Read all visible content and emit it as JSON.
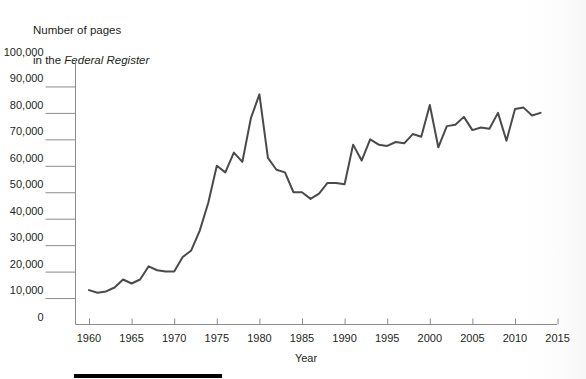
{
  "title": {
    "line1": "Number of pages",
    "line2_prefix": "in the ",
    "line2_italic": "Federal Register"
  },
  "axes": {
    "x_label": "Year",
    "y_ticks": [
      "100,000",
      "90,000",
      "80,000",
      "70,000",
      "60,000",
      "50,000",
      "40,000",
      "30,000",
      "20,000",
      "10,000",
      "0"
    ],
    "x_ticks": [
      "1960",
      "1965",
      "1970",
      "1975",
      "1980",
      "1985",
      "1990",
      "1995",
      "2000",
      "2005",
      "2010",
      "2015"
    ]
  },
  "colors": {
    "line": "#4a4a4a",
    "axis": "#8c8c8c",
    "text": "#231f20",
    "rule": "#000000"
  },
  "chart_data": {
    "type": "line",
    "title": "Number of pages in the Federal Register",
    "xlabel": "Year",
    "ylabel": "Number of pages in the Federal Register",
    "xlim": [
      1958,
      2016
    ],
    "ylim": [
      0,
      100000
    ],
    "grid": false,
    "legend": "none",
    "x": [
      1960,
      1961,
      1962,
      1963,
      1964,
      1965,
      1966,
      1967,
      1968,
      1969,
      1970,
      1971,
      1972,
      1973,
      1974,
      1975,
      1976,
      1977,
      1978,
      1979,
      1980,
      1981,
      1982,
      1983,
      1984,
      1985,
      1986,
      1987,
      1988,
      1989,
      1990,
      1991,
      1992,
      1993,
      1994,
      1995,
      1996,
      1997,
      1998,
      1999,
      2000,
      2001,
      2002,
      2003,
      2004,
      2005,
      2006,
      2007,
      2008,
      2009,
      2010,
      2011,
      2012,
      2013
    ],
    "values": [
      13000,
      12000,
      12500,
      14000,
      17000,
      15500,
      17000,
      22000,
      20500,
      20000,
      20000,
      25500,
      28000,
      35500,
      46000,
      60000,
      57500,
      65000,
      61500,
      78000,
      87000,
      63000,
      58500,
      57500,
      50000,
      50000,
      47500,
      49500,
      53500,
      53500,
      53000,
      68000,
      62000,
      70000,
      68000,
      67500,
      69000,
      68500,
      72000,
      71000,
      83000,
      67000,
      75000,
      75500,
      78500,
      73500,
      74500,
      74000,
      80000,
      69500,
      81500,
      82000,
      79000,
      80000
    ],
    "notes": {
      "peak": {
        "year": 1980,
        "value": 87000
      },
      "trough": {
        "year": 1986,
        "value": 47500
      },
      "spike_2000": {
        "year": 2000,
        "value": 83000
      },
      "drop_2001": {
        "year": 2001,
        "value": 67000
      }
    }
  }
}
